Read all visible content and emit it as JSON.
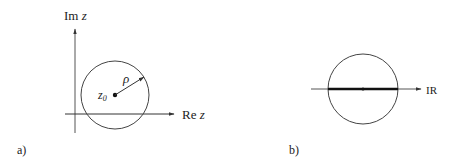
{
  "panel_a": {
    "label": "a)",
    "y_axis_label": {
      "prefix": "Im",
      "var": "z"
    },
    "x_axis_label": {
      "prefix": "Re",
      "var": "z"
    },
    "center_label": {
      "base": "z",
      "sub": "0"
    },
    "radius_label": "ρ",
    "circle": {
      "cx": 115,
      "cy": 95,
      "r": 34
    }
  },
  "panel_b": {
    "label": "b)",
    "axis_label": "IR",
    "circle": {
      "cx": 363,
      "cy": 89,
      "r": 35
    }
  },
  "colors": {
    "stroke": "#333333",
    "text": "#222222"
  }
}
